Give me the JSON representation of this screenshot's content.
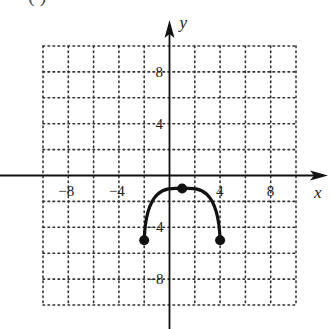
{
  "header": {
    "label_fragment": "(   )"
  },
  "chart_data": {
    "type": "line",
    "title": "",
    "xlabel": "x",
    "ylabel": "y",
    "xlim": [
      -10,
      10
    ],
    "ylim": [
      -10,
      10
    ],
    "grid": true,
    "grid_style": "dotted",
    "grid_step": 2,
    "x_ticks": [
      {
        "value": -8,
        "label": "-8"
      },
      {
        "value": -4,
        "label": "-4"
      },
      {
        "value": 4,
        "label": "4"
      },
      {
        "value": 8,
        "label": "8"
      }
    ],
    "y_ticks": [
      {
        "value": 8,
        "label": "8"
      },
      {
        "value": 4,
        "label": "4"
      },
      {
        "value": -4,
        "label": "-4"
      },
      {
        "value": -8,
        "label": "-8"
      }
    ],
    "series": [
      {
        "name": "arc",
        "shape": "downward arc",
        "points": [
          [
            -2,
            -5
          ],
          [
            -1,
            -2.8
          ],
          [
            0,
            -1.4
          ],
          [
            1,
            -1
          ],
          [
            2,
            -1.4
          ],
          [
            3,
            -2.8
          ],
          [
            4,
            -5
          ]
        ],
        "marked_points": [
          [
            -2,
            -5
          ],
          [
            1,
            -1
          ],
          [
            4,
            -5
          ]
        ],
        "color": "#111111"
      }
    ]
  }
}
